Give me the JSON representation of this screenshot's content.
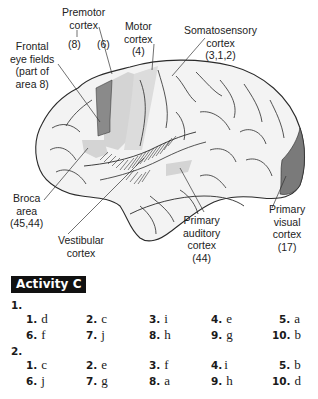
{
  "figure": {
    "labels": {
      "premotor": {
        "line1": "Premotor",
        "line2": "cortex",
        "sub8": "(8)",
        "sub6": "(6)"
      },
      "motor": {
        "line1": "Motor",
        "line2": "cortex",
        "line3": "(4)"
      },
      "somatosensory": {
        "line1": "Somatosensory",
        "line2": "cortex",
        "line3": "(3,1,2)"
      },
      "frontal_eye": {
        "line1": "Frontal",
        "line2": "eye fields",
        "line3": "(part of",
        "line4": "area 8)"
      },
      "broca": {
        "line1": "Broca",
        "line2": "area",
        "line3": "(45,44)"
      },
      "vestibular": {
        "line1": "Vestibular",
        "line2": "cortex"
      },
      "auditory": {
        "line1": "Primary",
        "line2": "auditory",
        "line3": "cortex",
        "line4": "(44)"
      },
      "visual": {
        "line1": "Primary",
        "line2": "visual",
        "line3": "cortex",
        "line4": "(17)"
      }
    },
    "colors": {
      "brain_fill": "#f3f3f3",
      "light_region": "#d4d4d4",
      "dark_region": "#8a8a8a",
      "outline": "#2a2a2a"
    }
  },
  "activity": {
    "title": "Activity C",
    "sections": [
      {
        "label": "1.",
        "rows": [
          [
            {
              "n": "1.",
              "a": "d"
            },
            {
              "n": "2.",
              "a": "c"
            },
            {
              "n": "3.",
              "a": "i"
            },
            {
              "n": "4.",
              "a": "e"
            },
            {
              "n": "5.",
              "a": "a"
            }
          ],
          [
            {
              "n": "6.",
              "a": "f"
            },
            {
              "n": "7.",
              "a": "j"
            },
            {
              "n": "8.",
              "a": "h"
            },
            {
              "n": "9.",
              "a": "g"
            },
            {
              "n": "10.",
              "a": "b"
            }
          ]
        ]
      },
      {
        "label": "2.",
        "rows": [
          [
            {
              "n": "1.",
              "a": "c"
            },
            {
              "n": "2.",
              "a": "e"
            },
            {
              "n": "3.",
              "a": "f"
            },
            {
              "n": "4.",
              "a": "i"
            },
            {
              "n": "5.",
              "a": "b"
            }
          ],
          [
            {
              "n": "6.",
              "a": "j"
            },
            {
              "n": "7.",
              "a": "g"
            },
            {
              "n": "8.",
              "a": "a"
            },
            {
              "n": "9.",
              "a": "h"
            },
            {
              "n": "10.",
              "a": "d"
            }
          ]
        ]
      }
    ]
  }
}
